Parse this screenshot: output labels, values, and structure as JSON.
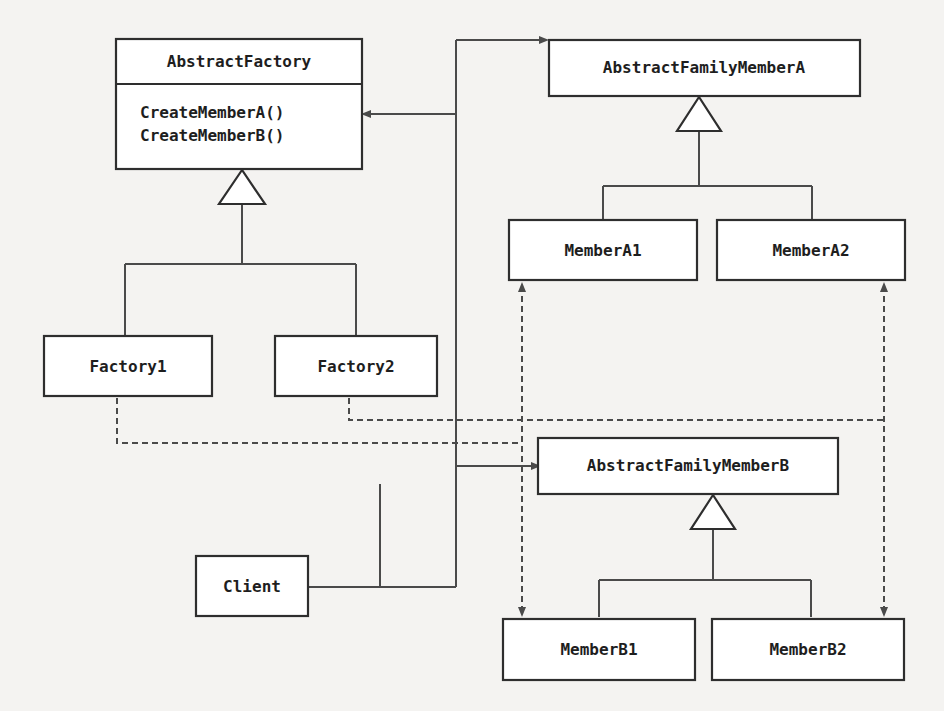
{
  "diagram": {
    "type": "uml-class-diagram",
    "pattern": "Abstract Factory",
    "classes": {
      "abstract_factory": {
        "name": "AbstractFactory",
        "methods": [
          "CreateMemberA()",
          "CreateMemberB()"
        ]
      },
      "factory1": {
        "name": "Factory1"
      },
      "factory2": {
        "name": "Factory2"
      },
      "abstract_member_a": {
        "name": "AbstractFamilyMemberA"
      },
      "member_a1": {
        "name": "MemberA1"
      },
      "member_a2": {
        "name": "MemberA2"
      },
      "abstract_member_b": {
        "name": "AbstractFamilyMemberB"
      },
      "member_b1": {
        "name": "MemberB1"
      },
      "member_b2": {
        "name": "MemberB2"
      },
      "client": {
        "name": "Client"
      }
    },
    "relationships": [
      {
        "from": "Factory1",
        "to": "AbstractFactory",
        "kind": "generalization"
      },
      {
        "from": "Factory2",
        "to": "AbstractFactory",
        "kind": "generalization"
      },
      {
        "from": "MemberA1",
        "to": "AbstractFamilyMemberA",
        "kind": "generalization"
      },
      {
        "from": "MemberA2",
        "to": "AbstractFamilyMemberA",
        "kind": "generalization"
      },
      {
        "from": "MemberB1",
        "to": "AbstractFamilyMemberB",
        "kind": "generalization"
      },
      {
        "from": "MemberB2",
        "to": "AbstractFamilyMemberB",
        "kind": "generalization"
      },
      {
        "from": "Client",
        "to": "AbstractFactory",
        "kind": "association"
      },
      {
        "from": "Client",
        "to": "AbstractFamilyMemberA",
        "kind": "association"
      },
      {
        "from": "Client",
        "to": "AbstractFamilyMemberB",
        "kind": "association"
      },
      {
        "from": "Factory1",
        "to": "MemberA1",
        "kind": "dependency"
      },
      {
        "from": "Factory1",
        "to": "MemberB1",
        "kind": "dependency"
      },
      {
        "from": "Factory2",
        "to": "MemberA2",
        "kind": "dependency"
      },
      {
        "from": "Factory2",
        "to": "MemberB2",
        "kind": "dependency"
      }
    ]
  },
  "background_bleed": {
    "large_text_1": "ent Fa",
    "large_text_2": "e",
    "small_text": ""
  }
}
